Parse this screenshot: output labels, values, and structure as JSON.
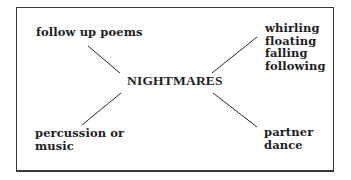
{
  "diagram": {
    "type": "mind-map",
    "center": {
      "label": "NIGHTMARES"
    },
    "branches": [
      {
        "position": "top-left",
        "lines": [
          "follow up poems"
        ]
      },
      {
        "position": "top-right",
        "lines": [
          "whirling",
          "floating",
          "falling",
          "following"
        ]
      },
      {
        "position": "bottom-left",
        "lines": [
          "percussion or",
          "music"
        ]
      },
      {
        "position": "bottom-right",
        "lines": [
          "partner",
          "dance"
        ]
      }
    ]
  }
}
